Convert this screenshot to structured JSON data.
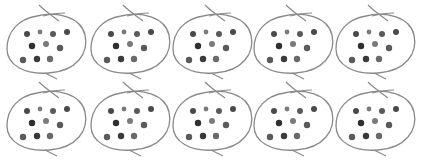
{
  "diagram": {
    "rows": 2,
    "columns": 5,
    "bag_count": 10,
    "dots_per_bag": 10,
    "total_dots": 100,
    "dot_rows_per_bag": [
      4,
      3,
      3
    ],
    "colors": {
      "background": "#ffffff",
      "bag_outline": "#8a8a8a",
      "dot_dark": "#3a3a3a",
      "dot_mid": "#5a5a5a",
      "dot_light": "#7a7a7a"
    },
    "bags": [
      {
        "row": 0,
        "col": 0,
        "dots": 10,
        "cx": 47,
        "cy": 43
      },
      {
        "row": 0,
        "col": 1,
        "dots": 10,
        "cx": 131,
        "cy": 43
      },
      {
        "row": 0,
        "col": 2,
        "dots": 10,
        "cx": 213,
        "cy": 43
      },
      {
        "row": 0,
        "col": 3,
        "dots": 10,
        "cx": 294,
        "cy": 43
      },
      {
        "row": 0,
        "col": 4,
        "dots": 10,
        "cx": 376,
        "cy": 43
      },
      {
        "row": 1,
        "col": 0,
        "dots": 10,
        "cx": 47,
        "cy": 120
      },
      {
        "row": 1,
        "col": 1,
        "dots": 10,
        "cx": 131,
        "cy": 120
      },
      {
        "row": 1,
        "col": 2,
        "dots": 10,
        "cx": 213,
        "cy": 120
      },
      {
        "row": 1,
        "col": 3,
        "dots": 10,
        "cx": 294,
        "cy": 120
      },
      {
        "row": 1,
        "col": 4,
        "dots": 10,
        "cx": 376,
        "cy": 120
      }
    ]
  }
}
